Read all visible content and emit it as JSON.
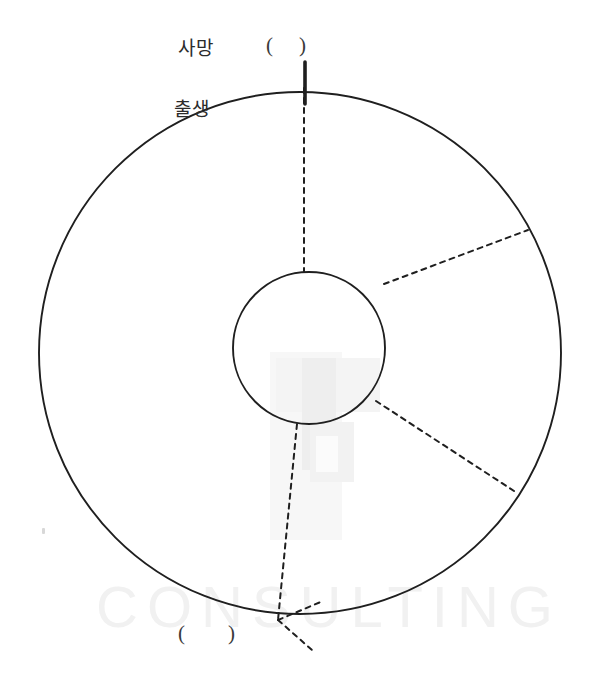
{
  "page": {
    "background_color": "#ffffff",
    "width": 589,
    "height": 680
  },
  "labels": {
    "death": "사망",
    "birth": "출생",
    "top_paren_open": "(",
    "top_paren_close": ")",
    "bottom_paren_open": "(",
    "bottom_paren_close": ")"
  },
  "watermark": {
    "text": "CONSULTING",
    "color": "#f1f1f1",
    "logo_name": "faint-logo-mark"
  },
  "diagram": {
    "stroke_color": "#1f1f1f",
    "outer_circle": {
      "cx": 300,
      "cy": 353,
      "r": 261
    },
    "inner_circle": {
      "cx": 309,
      "cy": 348,
      "r": 76
    },
    "tick_top": {
      "x": 305,
      "y1": 62,
      "y2": 104
    },
    "spokes": [
      {
        "name": "spoke-top",
        "x1": 304,
        "y1": 88,
        "x2": 304,
        "y2": 272
      },
      {
        "name": "spoke-upper-right",
        "x1": 384,
        "y1": 284,
        "x2": 528,
        "y2": 230
      },
      {
        "name": "spoke-lower-right",
        "x1": 376,
        "y1": 401,
        "x2": 514,
        "y2": 491
      },
      {
        "name": "spoke-bottom",
        "x1": 297,
        "y1": 424,
        "x2": 278,
        "y2": 620
      },
      {
        "name": "spoke-bottom-branch-up",
        "x1": 278,
        "y1": 620,
        "x2": 323,
        "y2": 601
      },
      {
        "name": "spoke-bottom-branch-down",
        "x1": 278,
        "y1": 620,
        "x2": 312,
        "y2": 650
      }
    ]
  }
}
